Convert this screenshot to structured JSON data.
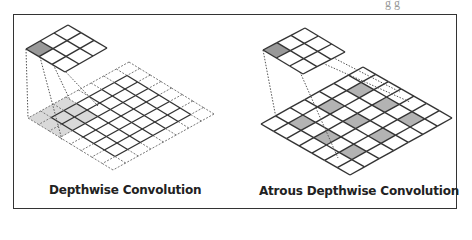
{
  "figure": {
    "top_fragment_text": "g  g",
    "panels": [
      {
        "id": "depthwise",
        "caption": "Depthwise Convolution",
        "kernel": {
          "size": 3,
          "shaded_cells": [
            [
              2,
              0
            ]
          ]
        },
        "input": {
          "size": 8,
          "padding": 1,
          "shaded_cells": [
            [
              5,
              0
            ],
            [
              5,
              1
            ],
            [
              5,
              2
            ],
            [
              6,
              0
            ],
            [
              6,
              1
            ],
            [
              6,
              2
            ],
            [
              7,
              0
            ],
            [
              7,
              1
            ],
            [
              7,
              2
            ]
          ]
        }
      },
      {
        "id": "atrous-depthwise",
        "caption": "Atrous Depthwise Convolution",
        "kernel": {
          "size": 3,
          "shaded_cells": [
            [
              2,
              0
            ]
          ]
        },
        "input": {
          "size": 7,
          "padding": 0,
          "dilation": 2,
          "shaded_cells": [
            [
              1,
              1
            ],
            [
              1,
              3
            ],
            [
              1,
              5
            ],
            [
              3,
              1
            ],
            [
              3,
              3
            ],
            [
              3,
              5
            ],
            [
              5,
              1
            ],
            [
              5,
              3
            ],
            [
              5,
              5
            ]
          ]
        }
      }
    ],
    "colors": {
      "line": "#333333",
      "dashed_line": "#777777",
      "kernel_shade": "#999999",
      "input_shade_left": "#d9d9d9",
      "input_shade_right": "#b3b3b3",
      "frame": "#333333"
    }
  }
}
